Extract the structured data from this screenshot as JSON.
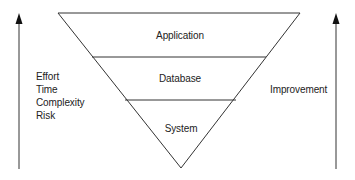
{
  "diagram": {
    "type": "inverted-pyramid",
    "layers": [
      {
        "label": "Application"
      },
      {
        "label": "Database"
      },
      {
        "label": "System"
      }
    ],
    "left_axis": {
      "direction": "up",
      "labels": [
        "Effort",
        "Time",
        "Complexity",
        "Risk"
      ]
    },
    "right_axis": {
      "direction": "up",
      "label": "Improvement"
    },
    "colors": {
      "line": "#333333",
      "text": "#222222",
      "background": "#ffffff"
    }
  }
}
